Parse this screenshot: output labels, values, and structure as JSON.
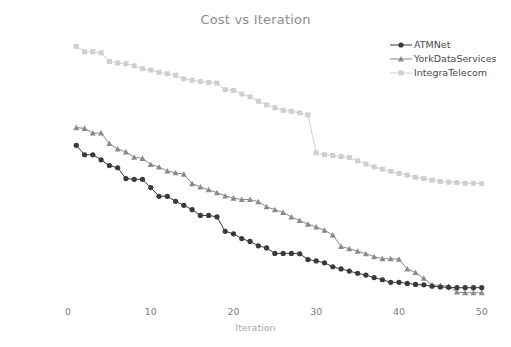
{
  "chart_data": {
    "type": "line",
    "title": "Cost vs Iteration",
    "xlabel": "Iteration",
    "ylabel": "Solution cost",
    "xlim": [
      0,
      51
    ],
    "ylim": [
      1350,
      2075
    ],
    "xticks": [
      0,
      10,
      20,
      30,
      40,
      50
    ],
    "yticks": [
      1400,
      1500,
      1600,
      1700,
      1800,
      1900,
      2000
    ],
    "grid": false,
    "legend_position": "upper right",
    "x": [
      1,
      2,
      3,
      4,
      5,
      6,
      7,
      8,
      9,
      10,
      11,
      12,
      13,
      14,
      15,
      16,
      17,
      18,
      19,
      20,
      21,
      22,
      23,
      24,
      25,
      26,
      27,
      28,
      29,
      30,
      31,
      32,
      33,
      34,
      35,
      36,
      37,
      38,
      39,
      40,
      41,
      42,
      43,
      44,
      45,
      46,
      47,
      48,
      49,
      50
    ],
    "series": [
      {
        "name": "ATMNet",
        "color": "#3a3a3a",
        "marker": "circle",
        "values": [
          1778,
          1752,
          1752,
          1738,
          1722,
          1716,
          1686,
          1684,
          1684,
          1661,
          1637,
          1637,
          1623,
          1612,
          1600,
          1584,
          1584,
          1580,
          1540,
          1533,
          1520,
          1512,
          1500,
          1494,
          1479,
          1479,
          1479,
          1478,
          1462,
          1458,
          1453,
          1442,
          1436,
          1430,
          1424,
          1419,
          1412,
          1406,
          1399,
          1399,
          1396,
          1393,
          1392,
          1388,
          1386,
          1385,
          1384,
          1384,
          1384,
          1384
        ]
      },
      {
        "name": "YorkDataServices",
        "color": "#8a8a8a",
        "marker": "triangle",
        "values": [
          1827,
          1825,
          1812,
          1812,
          1783,
          1768,
          1760,
          1745,
          1742,
          1725,
          1718,
          1707,
          1702,
          1698,
          1672,
          1663,
          1655,
          1647,
          1638,
          1632,
          1628,
          1628,
          1622,
          1608,
          1600,
          1592,
          1580,
          1570,
          1560,
          1552,
          1543,
          1530,
          1498,
          1492,
          1485,
          1478,
          1470,
          1464,
          1464,
          1463,
          1436,
          1426,
          1410,
          1392,
          1390,
          1388,
          1372,
          1370,
          1370,
          1370
        ]
      },
      {
        "name": "IntegraTelecom",
        "color": "#cfcfcf",
        "marker": "square",
        "values": [
          2052,
          2037,
          2037,
          2034,
          2010,
          2006,
          2004,
          1998,
          1990,
          1986,
          1980,
          1976,
          1972,
          1962,
          1958,
          1955,
          1952,
          1950,
          1932,
          1930,
          1920,
          1912,
          1900,
          1890,
          1882,
          1875,
          1872,
          1868,
          1862,
          1757,
          1752,
          1750,
          1747,
          1744,
          1735,
          1726,
          1718,
          1712,
          1706,
          1700,
          1696,
          1690,
          1686,
          1682,
          1678,
          1676,
          1675,
          1673,
          1673,
          1672
        ]
      }
    ]
  },
  "axis": {
    "ytick_labels": [
      "1400",
      "1500",
      "1600",
      "1700",
      "1800",
      "1900",
      "2000"
    ],
    "xtick_labels": [
      "0",
      "10",
      "20",
      "30",
      "40",
      "50"
    ]
  },
  "legend": {
    "entries": [
      {
        "label": "ATMNet"
      },
      {
        "label": "YorkDataServices"
      },
      {
        "label": "IntegraTelecom"
      }
    ]
  }
}
